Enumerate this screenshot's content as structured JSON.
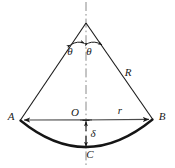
{
  "figure": {
    "background_color": "#ffffff",
    "line_color": "#1a1a1a",
    "centerline_color": "#777777",
    "labels": {
      "apex_angle_left": "θ",
      "apex_angle_right": "θ",
      "radius": "R",
      "point_a": "A",
      "point_o": "O",
      "point_b": "B",
      "point_c": "C",
      "half_chord": "r",
      "sagitta": "δ"
    },
    "elements": [
      {
        "name": "apex-vertex",
        "type": "point",
        "x": 86,
        "y": 23
      },
      {
        "name": "point-a",
        "type": "point",
        "x": 20,
        "y": 120
      },
      {
        "name": "point-b",
        "type": "point",
        "x": 153,
        "y": 119
      },
      {
        "name": "point-o",
        "type": "point",
        "x": 86,
        "y": 120
      },
      {
        "name": "point-c",
        "type": "point",
        "x": 86,
        "y": 148
      },
      {
        "name": "left-radius-line",
        "type": "line"
      },
      {
        "name": "right-radius-line",
        "type": "line"
      },
      {
        "name": "chord-line",
        "type": "double-arrow-line"
      },
      {
        "name": "sagitta-arrow",
        "type": "double-arrow-line"
      },
      {
        "name": "centerline",
        "type": "dash-dot-line"
      },
      {
        "name": "arc-ab",
        "type": "arc"
      },
      {
        "name": "angle-arc-left",
        "type": "angle-arc"
      },
      {
        "name": "angle-arc-right",
        "type": "angle-arc"
      }
    ]
  }
}
